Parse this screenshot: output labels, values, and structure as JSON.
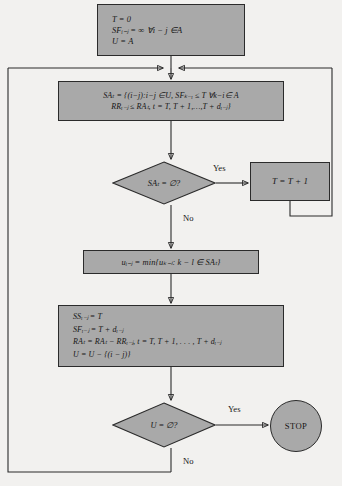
{
  "diagram": {
    "colors": {
      "node_fill": "#a9a9a9",
      "node_stroke": "#2b2b2b",
      "background": "#f2f1ef",
      "text": "#161616"
    }
  },
  "nodes": {
    "init": {
      "name": "initialization-box",
      "shape": "process",
      "lines": [
        "T = 0",
        "SFᵢ₋ⱼ = ∞        ∀i − j ∈A",
        "U = A"
      ]
    },
    "schedulable_set": {
      "name": "schedulable-set-box",
      "shape": "process",
      "lines": [
        "SAₜ = {(i−j):i−j ∈U, SFₖ₋ᵢ ≤ T ∀k−i∈ A",
        "RRᵢ₋ⱼ ≤ RAₜ, t = T, T + 1,…,T + dᵢ₋ⱼ}"
      ]
    },
    "time_increment": {
      "name": "time-increment-box",
      "shape": "process",
      "lines": [
        "T = T + 1"
      ]
    },
    "min_select": {
      "name": "min-activity-select-box",
      "shape": "process",
      "lines": [
        "uᵢ₋ⱼ = min{uₖ₋ₗ: k − l ∈ SAₜ}"
      ]
    },
    "update": {
      "name": "update-box",
      "shape": "process",
      "lines": [
        "SSᵢ₋ⱼ = T",
        "SFᵢ₋ⱼ = T + dᵢ₋ⱼ",
        "RAₜ =  RAₜ − RRᵢ₋ⱼ,  t = T, T + 1, . . . , T + dᵢ₋ⱼ",
        "U = U − {(i − j)}"
      ]
    },
    "decision_sat": {
      "name": "decision-schedulable-empty",
      "shape": "decision",
      "label": "SAₜ = ∅?"
    },
    "decision_u": {
      "name": "decision-unscheduled-empty",
      "shape": "decision",
      "label": "U = ∅?"
    },
    "stop": {
      "name": "stop-terminator",
      "shape": "terminator",
      "label": "STOP"
    }
  },
  "edges": {
    "yes_sat": "Yes",
    "no_sat": "No",
    "yes_u": "Yes",
    "no_u": "No"
  }
}
